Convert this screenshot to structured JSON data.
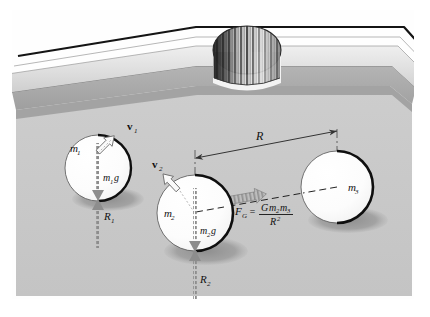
{
  "figure": {
    "scene": "pool-table-corner"
  },
  "colors": {
    "page_background": "#ffffff",
    "felt": "#c9c9c9",
    "felt_shadow_band": "#9c9c9c",
    "rail_top": "#dcdcdc",
    "rail_face": "#bdbdbd",
    "rail_edge_dark": "#1a1a1a",
    "ball_fill": "#ffffff",
    "ball_outline": "#111111",
    "ball_shadow": "#9a9a9a",
    "weight_arrow": "#8f8f8f",
    "normal_arrow": "#8f8f8f",
    "force_arrow": "#a8a8a8",
    "velocity_arrow_outline": "#6e6e6e",
    "dimension_line": "#333333",
    "pocket_dark": "#262626",
    "pocket_light": "#e8e8e8"
  },
  "balls": [
    {
      "id": "ball-1",
      "mass_label": "m",
      "mass_sub": "1",
      "cx": 98,
      "cy": 168,
      "r": 33
    },
    {
      "id": "ball-2",
      "mass_label": "m",
      "mass_sub": "2",
      "cx": 195,
      "cy": 213,
      "r": 38
    },
    {
      "id": "ball-3",
      "mass_label": "m",
      "mass_sub": "3",
      "cx": 337,
      "cy": 187,
      "r": 36
    }
  ],
  "labels": {
    "m1": "m",
    "m1_sub": "1",
    "m2": "m",
    "m2_sub": "2",
    "m3": "m",
    "m3_sub": "3",
    "v1": "v",
    "v1_sub": "1",
    "v2": "v",
    "v2_sub": "2",
    "weight1": "m",
    "weight1_sub": "1",
    "weight1_g": "g",
    "weight2": "m",
    "weight2_sub": "2",
    "weight2_g": "g",
    "normal1": "R",
    "normal1_sub": "1",
    "normal2": "R",
    "normal2_sub": "2",
    "distance": "R",
    "force": "F",
    "force_sub": "G",
    "equals": "=",
    "numerator_G": "G",
    "numerator_m2": "m",
    "numerator_m2_sub": "2",
    "numerator_m3": "m",
    "numerator_m3_sub": "3",
    "denominator_R": "R",
    "denominator_exp": "2"
  },
  "annotations": {
    "gravitation_formula": "F_G = G m2 m3 / R^2",
    "distance_dimension": "R",
    "normal_force_1": "R1",
    "normal_force_2": "R2",
    "weight_1": "m1 g",
    "weight_2": "m2 g",
    "velocity_1": "v1",
    "velocity_2": "v2"
  },
  "pocket": {
    "name": "corner-pocket",
    "cx": 247,
    "cy": 48,
    "rx": 34,
    "ry": 25
  }
}
